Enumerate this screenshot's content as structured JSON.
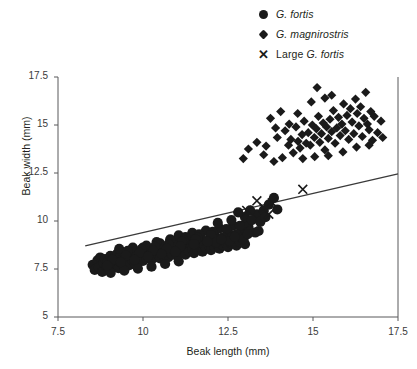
{
  "chart_data": {
    "type": "scatter",
    "title": "",
    "xlabel": "Beak length (mm)",
    "ylabel": "Beak width (mm)",
    "xlim": [
      7.5,
      17.5
    ],
    "ylim": [
      5,
      17.5
    ],
    "xticks": [
      7.5,
      10,
      12.5,
      15,
      17.5
    ],
    "yticks": [
      5,
      7.5,
      10,
      12.5,
      15,
      17.5
    ],
    "xtick_labels": [
      "7.5",
      "10",
      "12.5",
      "15",
      "17.5"
    ],
    "ytick_labels": [
      "5",
      "7.5",
      "10",
      "12.5",
      "15",
      "17.5"
    ],
    "grid": false,
    "legend_position": "top-right",
    "series": [
      {
        "name": "G. fortis",
        "marker": "circle",
        "color": "#1a1a1a",
        "points": [
          [
            8.52,
            7.72
          ],
          [
            8.58,
            7.45
          ],
          [
            8.66,
            7.95
          ],
          [
            8.7,
            7.58
          ],
          [
            8.74,
            8.1
          ],
          [
            8.8,
            7.35
          ],
          [
            8.84,
            7.82
          ],
          [
            8.88,
            8.02
          ],
          [
            8.92,
            7.62
          ],
          [
            8.96,
            7.9
          ],
          [
            9.0,
            7.48
          ],
          [
            9.04,
            8.18
          ],
          [
            9.08,
            7.74
          ],
          [
            9.12,
            8.05
          ],
          [
            9.16,
            7.6
          ],
          [
            9.2,
            7.92
          ],
          [
            9.24,
            8.3
          ],
          [
            9.28,
            7.55
          ],
          [
            9.32,
            8.12
          ],
          [
            9.36,
            7.8
          ],
          [
            9.4,
            8.0
          ],
          [
            9.44,
            7.66
          ],
          [
            9.48,
            8.22
          ],
          [
            9.52,
            7.88
          ],
          [
            9.56,
            8.08
          ],
          [
            9.6,
            7.7
          ],
          [
            9.64,
            8.35
          ],
          [
            9.68,
            7.96
          ],
          [
            9.72,
            8.15
          ],
          [
            9.76,
            7.78
          ],
          [
            9.8,
            8.26
          ],
          [
            9.84,
            8.02
          ],
          [
            9.88,
            7.88
          ],
          [
            9.92,
            8.4
          ],
          [
            9.96,
            8.12
          ],
          [
            10.0,
            7.92
          ],
          [
            10.05,
            8.28
          ],
          [
            10.1,
            8.05
          ],
          [
            10.15,
            8.45
          ],
          [
            10.2,
            8.18
          ],
          [
            10.25,
            7.98
          ],
          [
            10.3,
            8.36
          ],
          [
            10.35,
            8.1
          ],
          [
            10.4,
            8.52
          ],
          [
            10.45,
            8.24
          ],
          [
            10.5,
            8.05
          ],
          [
            10.55,
            8.42
          ],
          [
            10.6,
            8.2
          ],
          [
            10.65,
            8.58
          ],
          [
            10.7,
            8.3
          ],
          [
            10.75,
            8.12
          ],
          [
            10.8,
            8.48
          ],
          [
            10.85,
            8.26
          ],
          [
            10.9,
            8.62
          ],
          [
            10.95,
            8.38
          ],
          [
            11.0,
            8.18
          ],
          [
            11.05,
            8.55
          ],
          [
            11.1,
            8.34
          ],
          [
            11.15,
            8.7
          ],
          [
            11.2,
            8.45
          ],
          [
            11.25,
            8.25
          ],
          [
            11.3,
            8.64
          ],
          [
            11.35,
            8.42
          ],
          [
            11.4,
            8.8
          ],
          [
            11.45,
            8.52
          ],
          [
            11.5,
            8.32
          ],
          [
            11.55,
            8.72
          ],
          [
            11.6,
            8.5
          ],
          [
            11.65,
            8.88
          ],
          [
            11.7,
            8.6
          ],
          [
            11.75,
            8.4
          ],
          [
            11.8,
            8.78
          ],
          [
            11.85,
            8.58
          ],
          [
            11.9,
            8.96
          ],
          [
            11.95,
            8.68
          ],
          [
            12.0,
            8.48
          ],
          [
            12.05,
            8.86
          ],
          [
            12.1,
            8.66
          ],
          [
            12.15,
            9.05
          ],
          [
            12.2,
            8.76
          ],
          [
            12.25,
            8.56
          ],
          [
            12.3,
            8.95
          ],
          [
            12.35,
            8.74
          ],
          [
            12.4,
            9.12
          ],
          [
            12.45,
            8.84
          ],
          [
            12.5,
            8.64
          ],
          [
            12.55,
            9.02
          ],
          [
            12.6,
            8.82
          ],
          [
            12.65,
            9.2
          ],
          [
            12.7,
            8.92
          ],
          [
            12.75,
            8.72
          ],
          [
            12.8,
            9.1
          ],
          [
            12.85,
            8.9
          ],
          [
            12.9,
            9.28
          ],
          [
            12.95,
            9.0
          ],
          [
            13.0,
            8.8
          ],
          [
            9.05,
            7.3
          ],
          [
            9.45,
            7.42
          ],
          [
            9.85,
            7.52
          ],
          [
            10.25,
            7.62
          ],
          [
            10.65,
            7.76
          ],
          [
            11.05,
            7.9
          ],
          [
            9.3,
            8.55
          ],
          [
            9.7,
            8.62
          ],
          [
            10.1,
            8.72
          ],
          [
            10.5,
            8.84
          ],
          [
            10.9,
            8.94
          ],
          [
            11.3,
            9.06
          ],
          [
            11.7,
            9.18
          ],
          [
            12.1,
            9.32
          ],
          [
            12.5,
            9.44
          ],
          [
            12.9,
            9.58
          ],
          [
            13.1,
            9.7
          ],
          [
            13.3,
            9.4
          ],
          [
            11.05,
            9.25
          ],
          [
            11.45,
            9.38
          ],
          [
            11.85,
            9.5
          ],
          [
            12.25,
            9.62
          ],
          [
            12.65,
            9.76
          ],
          [
            13.05,
            9.9
          ],
          [
            12.2,
            9.9
          ],
          [
            12.6,
            10.05
          ],
          [
            13.0,
            10.2
          ],
          [
            13.35,
            10.35
          ],
          [
            13.55,
            10.55
          ],
          [
            13.7,
            10.85
          ],
          [
            13.2,
            10.05
          ],
          [
            12.85,
            9.75
          ],
          [
            12.45,
            9.58
          ],
          [
            12.05,
            9.44
          ],
          [
            11.65,
            9.3
          ],
          [
            11.25,
            9.16
          ],
          [
            13.45,
            9.95
          ],
          [
            13.6,
            10.2
          ],
          [
            13.15,
            10.55
          ],
          [
            12.8,
            10.45
          ],
          [
            13.85,
            11.2
          ],
          [
            13.95,
            10.6
          ],
          [
            10.0,
            8.62
          ],
          [
            10.4,
            8.9
          ],
          [
            10.8,
            9.05
          ],
          [
            11.2,
            8.98
          ],
          [
            11.6,
            9.12
          ],
          [
            12.0,
            9.26
          ],
          [
            9.55,
            8.45
          ],
          [
            9.95,
            8.52
          ],
          [
            10.35,
            8.66
          ],
          [
            10.75,
            8.8
          ],
          [
            11.15,
            8.92
          ],
          [
            11.55,
            9.04
          ],
          [
            12.35,
            9.15
          ],
          [
            12.75,
            9.3
          ],
          [
            13.15,
            9.45
          ],
          [
            12.95,
            9.05
          ],
          [
            12.55,
            8.95
          ],
          [
            12.15,
            8.88
          ],
          [
            9.1,
            7.98
          ],
          [
            9.5,
            8.18
          ],
          [
            9.9,
            8.34
          ],
          [
            10.3,
            8.46
          ],
          [
            10.7,
            8.56
          ],
          [
            11.1,
            8.68
          ],
          [
            11.5,
            8.8
          ],
          [
            11.9,
            8.92
          ],
          [
            12.3,
            9.04
          ],
          [
            12.7,
            9.18
          ],
          [
            13.08,
            9.32
          ],
          [
            13.4,
            9.48
          ],
          [
            8.95,
            7.68
          ],
          [
            9.35,
            7.86
          ],
          [
            9.75,
            7.98
          ],
          [
            10.15,
            8.14
          ],
          [
            10.55,
            8.28
          ],
          [
            10.95,
            8.4
          ]
        ]
      },
      {
        "name": "G. magnirostris",
        "marker": "diamond",
        "color": "#1a1a1a",
        "points": [
          [
            13.1,
            13.75
          ],
          [
            13.55,
            13.45
          ],
          [
            13.62,
            13.9
          ],
          [
            13.85,
            13.1
          ],
          [
            13.95,
            14.35
          ],
          [
            14.1,
            13.3
          ],
          [
            14.18,
            14.7
          ],
          [
            14.28,
            13.95
          ],
          [
            14.35,
            14.25
          ],
          [
            14.42,
            13.55
          ],
          [
            14.5,
            14.9
          ],
          [
            14.56,
            14.15
          ],
          [
            14.62,
            13.8
          ],
          [
            14.68,
            14.5
          ],
          [
            14.74,
            15.2
          ],
          [
            14.8,
            14.05
          ],
          [
            14.86,
            14.6
          ],
          [
            14.92,
            13.95
          ],
          [
            14.98,
            15.0
          ],
          [
            15.04,
            14.35
          ],
          [
            15.1,
            14.8
          ],
          [
            15.16,
            15.45
          ],
          [
            15.2,
            14.1
          ],
          [
            15.25,
            14.55
          ],
          [
            15.3,
            15.1
          ],
          [
            15.35,
            13.7
          ],
          [
            15.4,
            14.9
          ],
          [
            15.45,
            14.3
          ],
          [
            15.5,
            15.3
          ],
          [
            15.55,
            14.65
          ],
          [
            15.6,
            15.75
          ],
          [
            15.65,
            14.05
          ],
          [
            15.7,
            14.85
          ],
          [
            15.75,
            15.4
          ],
          [
            15.8,
            14.45
          ],
          [
            15.85,
            15.05
          ],
          [
            15.9,
            16.1
          ],
          [
            15.95,
            14.7
          ],
          [
            16.0,
            15.5
          ],
          [
            16.05,
            14.25
          ],
          [
            16.1,
            15.85
          ],
          [
            16.15,
            15.15
          ],
          [
            16.2,
            14.55
          ],
          [
            16.25,
            16.35
          ],
          [
            16.3,
            15.6
          ],
          [
            16.35,
            14.95
          ],
          [
            16.4,
            15.95
          ],
          [
            16.45,
            14.4
          ],
          [
            16.5,
            15.35
          ],
          [
            16.55,
            16.7
          ],
          [
            16.6,
            15.05
          ],
          [
            16.65,
            14.75
          ],
          [
            16.7,
            15.7
          ],
          [
            16.75,
            14.2
          ],
          [
            16.8,
            15.45
          ],
          [
            16.9,
            14.6
          ],
          [
            17.0,
            15.2
          ],
          [
            17.05,
            14.35
          ],
          [
            15.12,
            16.95
          ],
          [
            15.35,
            16.4
          ],
          [
            14.95,
            16.2
          ],
          [
            15.55,
            16.55
          ],
          [
            14.55,
            15.6
          ],
          [
            14.3,
            15.05
          ],
          [
            13.9,
            14.85
          ],
          [
            13.35,
            14.1
          ],
          [
            12.95,
            13.25
          ],
          [
            14.7,
            13.25
          ],
          [
            15.05,
            13.35
          ],
          [
            15.45,
            13.4
          ],
          [
            15.88,
            13.6
          ],
          [
            16.28,
            13.85
          ],
          [
            16.65,
            13.95
          ],
          [
            13.75,
            15.35
          ],
          [
            14.05,
            15.7
          ]
        ]
      },
      {
        "name": "Large G. fortis",
        "marker": "x",
        "color": "#1a1a1a",
        "points": [
          [
            13.05,
            10.55
          ],
          [
            13.35,
            11.05
          ],
          [
            13.55,
            10.7
          ],
          [
            13.7,
            10.35
          ],
          [
            13.8,
            10.95
          ],
          [
            14.7,
            11.65
          ]
        ]
      }
    ],
    "trendline": {
      "name": "regression-line",
      "color": "#3a3a3a",
      "x": [
        8.3,
        17.5
      ],
      "y": [
        8.7,
        12.46
      ]
    }
  },
  "legend": {
    "items": [
      {
        "marker": "circle",
        "label_italic": "G. fortis",
        "label_prefix": ""
      },
      {
        "marker": "diamond",
        "label_italic": "G. magnirostris",
        "label_prefix": ""
      },
      {
        "marker": "x",
        "label_italic": "G. fortis",
        "label_prefix": "Large "
      }
    ]
  },
  "caption": {
    "text": ""
  }
}
